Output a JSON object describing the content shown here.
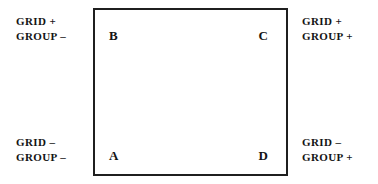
{
  "figure": {
    "box": {
      "corners": [
        {
          "id": "tl",
          "label": "B"
        },
        {
          "id": "tr",
          "label": "C"
        },
        {
          "id": "bl",
          "label": "A"
        },
        {
          "id": "br",
          "label": "D"
        }
      ]
    },
    "labels": {
      "top_left": {
        "line1": "GRID +",
        "line2": "GROUP –"
      },
      "top_right": {
        "line1": "GRID +",
        "line2": "GROUP +"
      },
      "bottom_left": {
        "line1": "GRID –",
        "line2": "GROUP –"
      },
      "bottom_right": {
        "line1": "GRID –",
        "line2": "GROUP +"
      }
    },
    "colors": {
      "background": "#ffffff",
      "ink": "#141414",
      "border": "#1f1f1f"
    }
  }
}
